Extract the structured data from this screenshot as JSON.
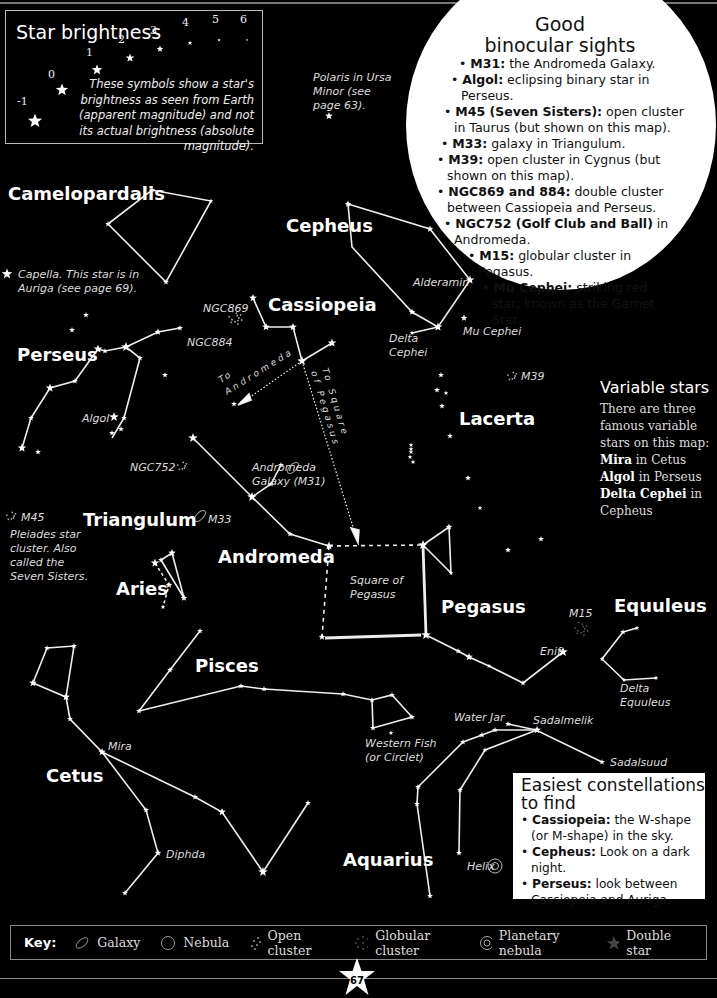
{
  "brightness_panel": {
    "title": "Star brightness",
    "magnitudes": [
      "-1",
      "0",
      "1",
      "2",
      "3",
      "4",
      "5",
      "6"
    ],
    "description": "These symbols show a star's brightness as seen from Earth (apparent magnitude) and not its actual brightness (absolute magnitude)."
  },
  "binocular_sights": {
    "title_line1": "Good",
    "title_line2": "binocular sights",
    "items": [
      {
        "bold": "M31:",
        "text": " the Andromeda Galaxy."
      },
      {
        "bold": "Algol:",
        "text": " eclipsing binary star in Perseus."
      },
      {
        "bold": "M45 (Seven Sisters):",
        "text": " open cluster in Taurus (but shown on this map)."
      },
      {
        "bold": "M33:",
        "text": " galaxy in Triangulum."
      },
      {
        "bold": "M39:",
        "text": " open cluster in Cygnus (but shown on this map)."
      },
      {
        "bold": "NGC869 and 884:",
        "text": " double cluster between Cassiopeia and Perseus."
      },
      {
        "bold": "NGC752 (Golf Club and Ball)",
        "text": " in Andromeda."
      },
      {
        "bold": "M15:",
        "text": " globular cluster in Pegasus."
      },
      {
        "bold": "Mu Cephei:",
        "text": " striking red star, known as the Garnet Star."
      }
    ]
  },
  "constellations": {
    "camelopardalis": "Camelopardalis",
    "cepheus": "Cepheus",
    "cassiopeia": "Cassiopeia",
    "perseus": "Perseus",
    "lacerta": "Lacerta",
    "triangulum": "Triangulum",
    "andromeda": "Andromeda",
    "aries": "Aries",
    "pegasus": "Pegasus",
    "equuleus": "Equuleus",
    "pisces": "Pisces",
    "cetus": "Cetus",
    "aquarius": "Aquarius"
  },
  "star_labels": {
    "polaris": [
      "Polaris in Ursa",
      "Minor (see",
      "page 63)."
    ],
    "capella": [
      "Capella. This star is in",
      "Auriga (see page 69)."
    ],
    "alderamin": "Alderamin",
    "mu_cephei": "Mu Cephei",
    "delta_cephei": [
      "Delta",
      "Cephei"
    ],
    "ngc869": "NGC869",
    "ngc884": "NGC884",
    "m39": "M39",
    "algol": "Algol",
    "ngc752": "NGC752",
    "andromeda_galaxy": [
      "Andromeda",
      "Galaxy (M31)"
    ],
    "m33": "M33",
    "m45": "M45",
    "pleiades": [
      "Pleiades star",
      "cluster. Also",
      "called the",
      "Seven Sisters."
    ],
    "to_andromeda": [
      "To",
      "Andromeda"
    ],
    "to_square": [
      "To Square",
      "of Pegasus"
    ],
    "square_of_pegasus": [
      "Square of",
      "Pegasus"
    ],
    "m15": "M15",
    "enif": "Enif",
    "delta_equuleus": [
      "Delta",
      "Equuleus"
    ],
    "mira": "Mira",
    "western_fish": [
      "Western Fish",
      "(or Circlet)"
    ],
    "water_jar": "Water Jar",
    "sadalmelik": "Sadalmelik",
    "sadalsuud": "Sadalsuud",
    "diphda": "Diphda",
    "helix": "Helix"
  },
  "variable_stars": {
    "title": "Variable stars",
    "intro": [
      "There are three",
      "famous variable",
      "stars on this map:"
    ],
    "items": [
      {
        "bold": "Mira",
        "text": " in Cetus"
      },
      {
        "bold": "Algol",
        "text": " in Perseus"
      },
      {
        "bold": "Delta Cephei",
        "text": " in"
      },
      {
        "bold": "",
        "text": "Cepheus"
      }
    ]
  },
  "easiest": {
    "title_line1": "Easiest constellations",
    "title_line2": "to find",
    "items": [
      {
        "bold": "Cassiopeia:",
        "text": " the W-shape (or M-shape) in the sky."
      },
      {
        "bold": "Cepheus:",
        "text": " Look on a dark night."
      },
      {
        "bold": "Perseus:",
        "text": " look between Cassiopeia and Auriga."
      }
    ]
  },
  "key": {
    "title": "Key:",
    "items": [
      {
        "icon": "galaxy-icon",
        "label": "Galaxy"
      },
      {
        "icon": "nebula-icon",
        "label": "Nebula"
      },
      {
        "icon": "open-cluster-icon",
        "label": "Open cluster"
      },
      {
        "icon": "globular-cluster-icon",
        "label": "Globular cluster"
      },
      {
        "icon": "planetary-nebula-icon",
        "label": "Planetary nebula"
      },
      {
        "icon": "double-star-icon",
        "label": "Double star"
      }
    ]
  },
  "page_number": "67",
  "colors": {
    "background": "#000000",
    "foreground": "#ffffff",
    "panel_text": "#111111"
  }
}
